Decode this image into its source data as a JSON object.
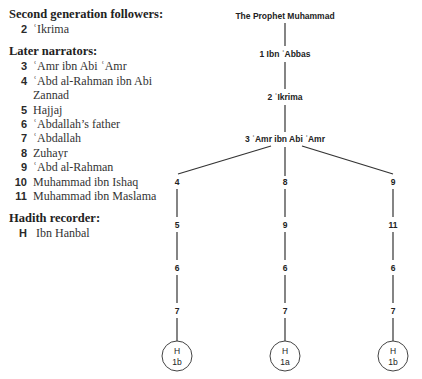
{
  "legend": {
    "second_generation": {
      "heading": "Second generation followers:",
      "items": [
        {
          "num": "2",
          "name": "ʿIkrima"
        }
      ]
    },
    "later_narrators": {
      "heading": "Later narrators:",
      "items": [
        {
          "num": "3",
          "name": "ʿAmr ibn Abi ʿAmr"
        },
        {
          "num": "4",
          "name": "ʿAbd al-Rahman ibn Abi Zannad"
        },
        {
          "num": "5",
          "name": "Hajjaj"
        },
        {
          "num": "6",
          "name": "ʿAbdallah’s father"
        },
        {
          "num": "7",
          "name": "ʿAbdallah"
        },
        {
          "num": "8",
          "name": "Zuhayr"
        },
        {
          "num": "9",
          "name": "ʿAbd al-Rahman"
        },
        {
          "num": "10",
          "name": "Muhammad ibn Ishaq"
        },
        {
          "num": "11",
          "name": "Muhammad ibn Maslama"
        }
      ]
    },
    "recorder": {
      "heading": "Hadith recorder:",
      "code": "H",
      "name": "Ibn Hanbal"
    }
  },
  "tree": {
    "root": "The Prophet Muhammad",
    "chain": [
      "1 Ibn ʿAbbas",
      "2 ʿIkrima",
      "3 ʿAmr ibn Abi ʿAmr"
    ],
    "branches": [
      {
        "nodes": [
          "4",
          "5",
          "6",
          "7"
        ],
        "end": {
          "top": "H",
          "bottom": "1b"
        }
      },
      {
        "nodes": [
          "8",
          "9",
          "6",
          "7"
        ],
        "end": {
          "top": "H",
          "bottom": "1a"
        }
      },
      {
        "nodes": [
          "9",
          "11",
          "6",
          "7"
        ],
        "end": {
          "top": "H",
          "bottom": "1b"
        }
      }
    ]
  }
}
